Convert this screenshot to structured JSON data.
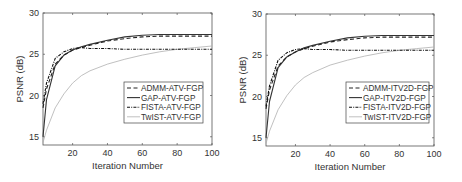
{
  "chart_data": [
    {
      "type": "line",
      "title": "",
      "xlabel": "Iteration Number",
      "ylabel": "PSNR (dB)",
      "xlim": [
        3,
        100
      ],
      "ylim": [
        14,
        30
      ],
      "xticks": [
        20,
        40,
        60,
        80,
        100
      ],
      "yticks": [
        15,
        20,
        25,
        30
      ],
      "grid": false,
      "legend_position": "lower right (inside)",
      "x": [
        3,
        5,
        10,
        15,
        20,
        25,
        30,
        40,
        50,
        60,
        70,
        80,
        90,
        100
      ],
      "series": [
        {
          "name": "ADMM-ATV-FGP",
          "style": "dashed",
          "color": "#222222",
          "values": [
            18.5,
            20.8,
            23.8,
            24.9,
            25.5,
            25.8,
            26.1,
            26.6,
            26.9,
            27.1,
            27.2,
            27.2,
            27.2,
            27.2
          ]
        },
        {
          "name": "GAP-ATV-FGP",
          "style": "solid",
          "color": "#333333",
          "values": [
            15.0,
            19.5,
            23.6,
            24.9,
            25.5,
            25.9,
            26.2,
            26.7,
            27.1,
            27.3,
            27.4,
            27.4,
            27.4,
            27.4
          ]
        },
        {
          "name": "FISTA-ATV-FGP",
          "style": "dash-dot",
          "color": "#111111",
          "values": [
            19.0,
            21.5,
            24.5,
            25.3,
            25.7,
            25.8,
            25.7,
            25.7,
            25.6,
            25.6,
            25.6,
            25.6,
            25.6,
            25.6
          ]
        },
        {
          "name": "TwIST-ATV-FGP",
          "style": "solid",
          "color": "#b0b0b0",
          "values": [
            14.3,
            15.8,
            18.5,
            20.2,
            21.5,
            22.4,
            23.0,
            23.8,
            24.4,
            24.9,
            25.3,
            25.6,
            25.8,
            26.0
          ]
        }
      ]
    },
    {
      "type": "line",
      "title": "",
      "xlabel": "Iteration Number",
      "ylabel": "PSNR (dB)",
      "xlim": [
        3,
        100
      ],
      "ylim": [
        14,
        30
      ],
      "xticks": [
        20,
        40,
        60,
        80,
        100
      ],
      "yticks": [
        15,
        20,
        25,
        30
      ],
      "grid": false,
      "legend_position": "lower right (inside)",
      "x": [
        3,
        5,
        10,
        15,
        20,
        25,
        30,
        40,
        50,
        60,
        70,
        80,
        90,
        100
      ],
      "series": [
        {
          "name": "ADMM-ITV2D-FGP",
          "style": "dashed",
          "color": "#222222",
          "values": [
            18.5,
            20.8,
            23.7,
            24.8,
            25.4,
            25.8,
            26.1,
            26.6,
            26.9,
            27.1,
            27.2,
            27.2,
            27.2,
            27.2
          ]
        },
        {
          "name": "GAP-ITV2D-FGP",
          "style": "solid",
          "color": "#333333",
          "values": [
            15.0,
            19.4,
            23.5,
            24.8,
            25.4,
            25.9,
            26.2,
            26.7,
            27.1,
            27.3,
            27.4,
            27.4,
            27.4,
            27.4
          ]
        },
        {
          "name": "FISTA-ITV2D-FGP",
          "style": "dash-dot",
          "color": "#111111",
          "values": [
            18.8,
            21.3,
            24.4,
            25.3,
            25.7,
            25.8,
            25.7,
            25.7,
            25.6,
            25.6,
            25.6,
            25.6,
            25.6,
            25.6
          ]
        },
        {
          "name": "TwIST-ITV2D-FGP",
          "style": "solid",
          "color": "#b0b0b0",
          "values": [
            14.3,
            15.8,
            18.4,
            20.1,
            21.4,
            22.3,
            22.9,
            23.8,
            24.4,
            24.9,
            25.3,
            25.6,
            25.8,
            26.0
          ]
        }
      ]
    }
  ]
}
